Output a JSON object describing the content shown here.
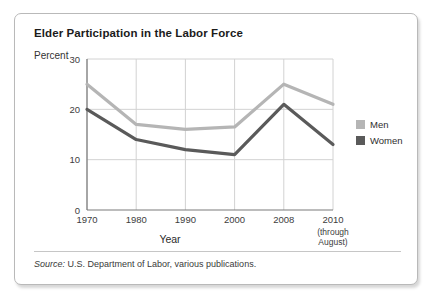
{
  "card": {
    "title": "Elder Participation in the Labor Force",
    "source_prefix": "Source:",
    "source_text": " U.S. Department of Labor, various publications."
  },
  "legend": {
    "items": [
      {
        "label": "Men",
        "color": "#b5b5b5"
      },
      {
        "label": "Women",
        "color": "#5a5a5a"
      }
    ]
  },
  "chart_data": {
    "type": "line",
    "title": "Elder Participation in the Labor Force",
    "xlabel": "Year",
    "ylabel": "Percent",
    "categories": [
      "1970",
      "1980",
      "1990",
      "2000",
      "2008",
      "2010"
    ],
    "category_sublabels": [
      "",
      "",
      "",
      "",
      "",
      "(through August)"
    ],
    "series": [
      {
        "name": "Men",
        "color": "#b5b5b5",
        "values": [
          25,
          17,
          16,
          16.5,
          25,
          21
        ]
      },
      {
        "name": "Women",
        "color": "#5a5a5a",
        "values": [
          20,
          14,
          12,
          11,
          21,
          13
        ]
      }
    ],
    "ylim": [
      0,
      30
    ],
    "yticks": [
      0,
      10,
      20,
      30
    ],
    "grid": true,
    "legend_position": "right"
  }
}
